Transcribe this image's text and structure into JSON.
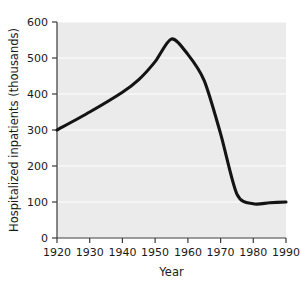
{
  "chart_data": {
    "type": "line",
    "title": "",
    "xlabel": "Year",
    "ylabel": "Hospitalized inpatients (thousands)",
    "xlim": [
      1920,
      1990
    ],
    "ylim": [
      0,
      600
    ],
    "xticks": [
      1920,
      1930,
      1940,
      1950,
      1960,
      1970,
      1980,
      1990
    ],
    "xtick_labels": [
      "1920",
      "1930",
      "1940",
      "1950",
      "1960",
      "1970",
      "1980",
      "1990"
    ],
    "yticks": [
      0,
      100,
      200,
      300,
      400,
      500,
      600
    ],
    "ytick_labels": [
      "0",
      "100",
      "200",
      "300",
      "400",
      "500",
      "600"
    ],
    "grid": "horizontal-white-on-gray",
    "legend": "none",
    "series": [
      {
        "name": "Hospitalized inpatients",
        "x": [
          1920,
          1930,
          1940,
          1945,
          1950,
          1955,
          1960,
          1965,
          1970,
          1975,
          1980,
          1985,
          1990
        ],
        "values": [
          300,
          350,
          405,
          440,
          490,
          553,
          510,
          437,
          290,
          122,
          95,
          98,
          100
        ]
      }
    ],
    "annotations": [
      {
        "label": "peak",
        "x": 1955,
        "y": 553
      },
      {
        "label": "start",
        "x": 1920,
        "y": 300
      },
      {
        "label": "end",
        "x": 1990,
        "y": 100
      }
    ],
    "colors": {
      "line": "#141414",
      "plot_background": "#ebebeb",
      "gridline": "#ffffff",
      "axis": "#3a3a3a",
      "text": "#1a1a1a",
      "figure_background": "#ffffff"
    }
  }
}
